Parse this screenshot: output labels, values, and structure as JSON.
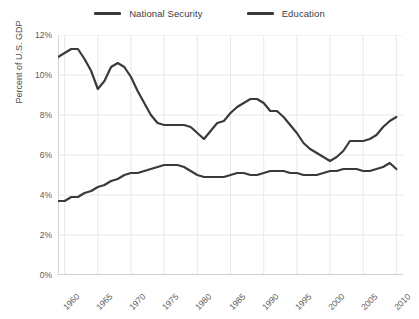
{
  "chart_data": {
    "type": "line",
    "title": "",
    "xlabel": "",
    "ylabel": "Percent of U.S. GDP",
    "xlim": [
      1959,
      2011
    ],
    "ylim": [
      0,
      12
    ],
    "ytick_labels": [
      "0%",
      "2%",
      "4%",
      "6%",
      "8%",
      "10%",
      "12%"
    ],
    "ytick_values": [
      0,
      2,
      4,
      6,
      8,
      10,
      12
    ],
    "xtick_labels": [
      "1960",
      "1965",
      "1970",
      "1975",
      "1980",
      "1985",
      "1990",
      "1995",
      "2000",
      "2005",
      "2010"
    ],
    "xtick_values": [
      1960,
      1965,
      1970,
      1975,
      1980,
      1985,
      1990,
      1995,
      2000,
      2005,
      2010
    ],
    "grid": true,
    "legend_position": "top-center",
    "line_color": "#3a3a3a",
    "grid_color": "#e8e8e8",
    "x": [
      1959,
      1960,
      1961,
      1962,
      1963,
      1964,
      1965,
      1966,
      1967,
      1968,
      1969,
      1970,
      1971,
      1972,
      1973,
      1974,
      1975,
      1976,
      1977,
      1978,
      1979,
      1980,
      1981,
      1982,
      1983,
      1984,
      1985,
      1986,
      1987,
      1988,
      1989,
      1990,
      1991,
      1992,
      1993,
      1994,
      1995,
      1996,
      1997,
      1998,
      1999,
      2000,
      2001,
      2002,
      2003,
      2004,
      2005,
      2006,
      2007,
      2008,
      2009,
      2010
    ],
    "series": [
      {
        "name": "National Security",
        "values": [
          10.9,
          11.1,
          11.3,
          11.3,
          10.8,
          10.2,
          9.3,
          9.7,
          10.4,
          10.6,
          10.4,
          9.9,
          9.2,
          8.6,
          8.0,
          7.6,
          7.5,
          7.5,
          7.5,
          7.5,
          7.4,
          7.1,
          6.8,
          7.2,
          7.6,
          7.7,
          8.1,
          8.4,
          8.6,
          8.8,
          8.8,
          8.6,
          8.2,
          8.2,
          7.9,
          7.5,
          7.1,
          6.6,
          6.3,
          6.1,
          5.9,
          5.7,
          5.9,
          6.2,
          6.7,
          6.7,
          6.7,
          6.8,
          7.0,
          7.4,
          7.7,
          7.9
        ]
      },
      {
        "name": "Education",
        "values": [
          3.7,
          3.7,
          3.9,
          3.9,
          4.1,
          4.2,
          4.4,
          4.5,
          4.7,
          4.8,
          5.0,
          5.1,
          5.1,
          5.2,
          5.3,
          5.4,
          5.5,
          5.5,
          5.5,
          5.4,
          5.2,
          5.0,
          4.9,
          4.9,
          4.9,
          4.9,
          5.0,
          5.1,
          5.1,
          5.0,
          5.0,
          5.1,
          5.2,
          5.2,
          5.2,
          5.1,
          5.1,
          5.0,
          5.0,
          5.0,
          5.1,
          5.2,
          5.2,
          5.3,
          5.3,
          5.3,
          5.2,
          5.2,
          5.3,
          5.4,
          5.6,
          5.3
        ]
      }
    ]
  },
  "legend": {
    "items": [
      {
        "label": "National Security"
      },
      {
        "label": "Education"
      }
    ]
  }
}
